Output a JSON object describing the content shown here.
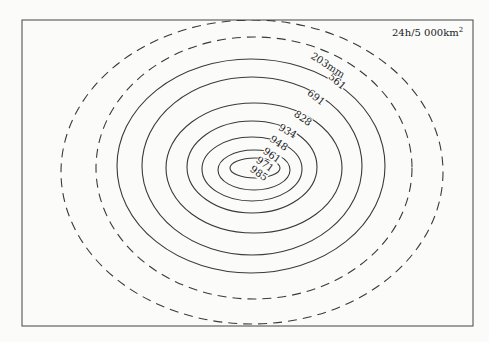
{
  "figure": {
    "unit_label": "24h/5 000km",
    "unit_superscript": "2",
    "frame": {
      "x": 22,
      "y": 20,
      "width": 451,
      "height": 306
    },
    "colors": {
      "line": "#3a3a3a",
      "frame": "#555555",
      "background": "#fbfbfa"
    }
  },
  "contours": [
    {
      "value": "203mm",
      "style": "dashed",
      "cx": 252,
      "cy": 172,
      "rx": 191,
      "ry": 152
    },
    {
      "value": "561",
      "style": "dashed",
      "cx": 254,
      "cy": 168,
      "rx": 158,
      "ry": 131
    },
    {
      "value": "691",
      "style": "solid",
      "cx": 251,
      "cy": 166,
      "rx": 134,
      "ry": 107
    },
    {
      "value": "828",
      "style": "solid",
      "cx": 252,
      "cy": 166,
      "rx": 110,
      "ry": 89
    },
    {
      "value": "934",
      "style": "solid",
      "cx": 254,
      "cy": 168,
      "rx": 88,
      "ry": 65
    },
    {
      "value": "948",
      "style": "solid",
      "cx": 252,
      "cy": 167,
      "rx": 65,
      "ry": 46
    },
    {
      "value": "961",
      "style": "solid",
      "cx": 252,
      "cy": 169,
      "rx": 50,
      "ry": 32
    },
    {
      "value": "971",
      "style": "solid",
      "cx": 254,
      "cy": 170,
      "rx": 36,
      "ry": 20
    },
    {
      "value": "985",
      "style": "solid",
      "cx": 255,
      "cy": 168,
      "rx": 25,
      "ry": 10
    }
  ],
  "labels": [
    {
      "text": "203mm",
      "x": 326,
      "y": 68,
      "angle": 33
    },
    {
      "text": "561",
      "x": 335,
      "y": 84,
      "angle": 40
    },
    {
      "text": "691",
      "x": 314,
      "y": 100,
      "angle": 38
    },
    {
      "text": "828",
      "x": 301,
      "y": 121,
      "angle": 35
    },
    {
      "text": "934",
      "x": 286,
      "y": 134,
      "angle": 30
    },
    {
      "text": "948",
      "x": 277,
      "y": 146,
      "angle": 33
    },
    {
      "text": "961",
      "x": 270,
      "y": 158,
      "angle": 35
    },
    {
      "text": "971",
      "x": 263,
      "y": 167,
      "angle": 35
    },
    {
      "text": "985",
      "x": 257,
      "y": 176,
      "angle": 35
    }
  ],
  "chart_data": {
    "type": "contour",
    "levels": [
      203,
      561,
      691,
      828,
      934,
      948,
      961,
      971,
      985
    ],
    "unit": "mm",
    "dashed_levels": [
      203,
      561
    ],
    "solid_levels": [
      691,
      828,
      934,
      948,
      961,
      971,
      985
    ]
  }
}
